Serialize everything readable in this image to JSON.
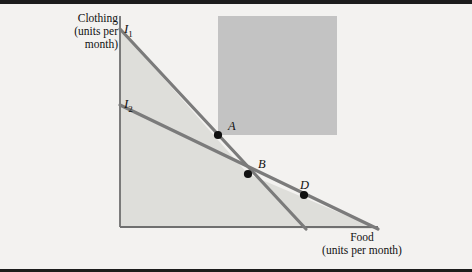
{
  "figure": {
    "background_color": "#f3f2f0",
    "rule_color": "#1c1c1c",
    "axis_color": "#6f6f6f",
    "line_color": "#7b7b7b",
    "point_color": "#111111",
    "shade_light": "#dededa",
    "shade_dark": "#c3c3c3",
    "y_axis_label": "Clothing\n(units per\nmonth)",
    "x_axis_label": "Food\n(units per month)"
  },
  "chart_data": {
    "type": "line",
    "title": "",
    "xlabel": "Food (units per month)",
    "ylabel": "Clothing (units per month)",
    "grid": false,
    "legend": "inline-curve-labels",
    "axis": {
      "origin_px": [
        120,
        227
      ],
      "y_top_px": [
        120,
        16
      ],
      "x_right_px": [
        378,
        227
      ]
    },
    "series": [
      {
        "name": "I1",
        "label": "I",
        "subscript": "1",
        "description": "steeper budget line",
        "from_px": [
          120,
          29
        ],
        "to_px": [
          306,
          229
        ],
        "y_intercept_px": 29,
        "x_intercept_px": 306
      },
      {
        "name": "I2",
        "label": "I",
        "subscript": "2",
        "description": "flatter budget line",
        "from_px": [
          120,
          105
        ],
        "to_px": [
          378,
          229
        ],
        "y_intercept_px": 105,
        "x_intercept_px": 378
      }
    ],
    "points": [
      {
        "name": "A",
        "label": "A",
        "on": "I1",
        "px": [
          218,
          135
        ]
      },
      {
        "name": "B",
        "label": "B",
        "on": "I1 and I2 intersection",
        "px": [
          248,
          174
        ]
      },
      {
        "name": "D",
        "label": "D",
        "on": "I2",
        "px": [
          304,
          195
        ]
      }
    ],
    "regions": [
      {
        "name": "budget-set-shading",
        "description": "light gray area under the upper envelope of both budget lines",
        "fill": "#dededa"
      },
      {
        "name": "highlight-rectangle",
        "description": "darker gray rectangle with bottom-left corner at point A",
        "fill": "#c3c3c3",
        "x_px": 218,
        "y_px": 16,
        "width_px": 119,
        "height_px": 119
      }
    ]
  }
}
